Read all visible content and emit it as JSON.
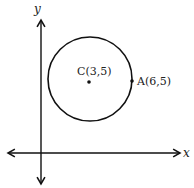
{
  "axes": {
    "x_label": "x",
    "y_label": "y"
  },
  "points": {
    "center": {
      "label": "C(3,5)",
      "x": 3,
      "y": 5
    },
    "point_a": {
      "label": "A(6,5)",
      "x": 6,
      "y": 5
    }
  },
  "circle": {
    "center": "C(3,5)",
    "radius": 3
  },
  "colors": {
    "stroke": "#111111",
    "background": "#ffffff"
  }
}
